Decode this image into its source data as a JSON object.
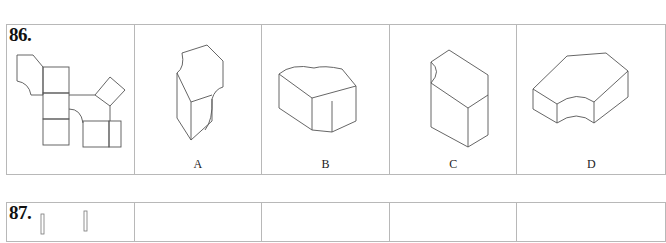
{
  "questions": [
    {
      "number": "86.",
      "figure": "net-diagram",
      "options": [
        {
          "label": "A",
          "figure": "solid-a"
        },
        {
          "label": "B",
          "figure": "solid-b"
        },
        {
          "label": "C",
          "figure": "solid-c"
        },
        {
          "label": "D",
          "figure": "solid-d"
        }
      ]
    },
    {
      "number": "87.",
      "figure": "net-diagram-partial",
      "options": []
    }
  ]
}
